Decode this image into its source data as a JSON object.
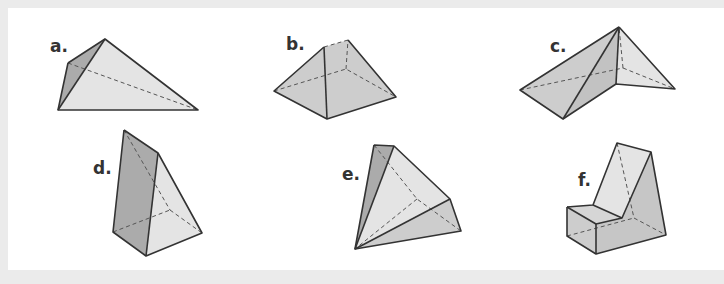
{
  "figure": {
    "shapes": [
      {
        "id": "a",
        "label": "a."
      },
      {
        "id": "b",
        "label": "b."
      },
      {
        "id": "c",
        "label": "c."
      },
      {
        "id": "d",
        "label": "d."
      },
      {
        "id": "e",
        "label": "e."
      },
      {
        "id": "f",
        "label": "f."
      }
    ]
  },
  "colors": {
    "background": "#ebebeb",
    "panel": "#ffffff",
    "edge": "#333333",
    "face_dark": "#ababab",
    "face_mid": "#cdcdcd",
    "face_light": "#e4e4e4"
  }
}
